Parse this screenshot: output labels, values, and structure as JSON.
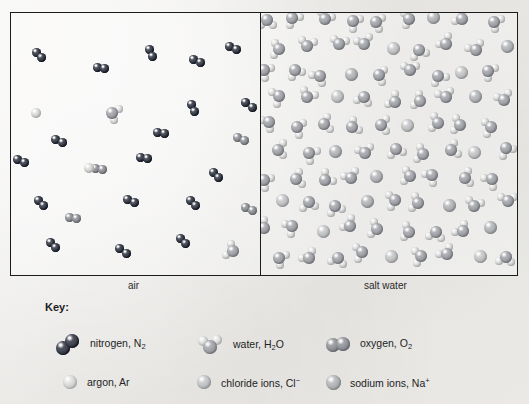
{
  "figure": {
    "panels": [
      {
        "id": "air",
        "caption": "air"
      },
      {
        "id": "salt-water",
        "caption": "salt water"
      }
    ]
  },
  "key": {
    "title": "Key:",
    "entries": [
      {
        "id": "nitrogen",
        "icon": "nitrogen-molecule-icon",
        "label_html": "nitrogen, N<sub>2</sub>",
        "label_text": "nitrogen, N2"
      },
      {
        "id": "water",
        "icon": "water-molecule-icon",
        "label_html": "water, H<sub>2</sub>O",
        "label_text": "water, H2O"
      },
      {
        "id": "oxygen",
        "icon": "oxygen-molecule-icon",
        "label_html": "oxygen, O<sub>2</sub>",
        "label_text": "oxygen, O2"
      },
      {
        "id": "argon",
        "icon": "argon-atom-icon",
        "label_html": "argon, Ar",
        "label_text": "argon, Ar"
      },
      {
        "id": "chloride-ion",
        "icon": "chloride-ion-icon",
        "label_html": "chloride ions, Cl<sup>&#8722;</sup>",
        "label_text": "chloride ions, Cl-"
      },
      {
        "id": "sodium-ion",
        "icon": "sodium-ion-icon",
        "label_html": "sodium ions, Na<sup>+</sup>",
        "label_text": "sodium ions, Na+"
      }
    ]
  },
  "colors": {
    "nitrogen": "#3b3f४a",
    "nitrogen_hex": "#3a3e49",
    "oxygen": "#8b8d92",
    "water_oxygen": "#9a9ca1",
    "hydrogen": "#d2d3d2",
    "argon": "#cfd0ce",
    "chloride": "#b9babb",
    "sodium": "#a9abae",
    "frame": "#1c1c1c",
    "paper": "#efeeec",
    "text": "#232323"
  },
  "chart_data": {
    "type": "diagram",
    "particle_sizes": {
      "nitrogen_atom": 9,
      "oxygen_atom": 9,
      "water_oxygen": 12,
      "water_hydrogen": 8,
      "argon_atom": 10,
      "chloride_ion": 13,
      "sodium_ion": 13
    },
    "panels": [
      {
        "id": "air",
        "caption": "air",
        "description": "Sparse, widely separated particles representing a gas",
        "composition": [
          {
            "species": "nitrogen, N2",
            "count": 18
          },
          {
            "species": "oxygen, O2",
            "count": 5
          },
          {
            "species": "argon, Ar",
            "count": 2
          },
          {
            "species": "water, H2O",
            "count": 2
          }
        ],
        "molecules": [
          {
            "type": "nitrogen",
            "x": 28,
            "y": 42,
            "rot": 38
          },
          {
            "type": "nitrogen",
            "x": 90,
            "y": 55,
            "rot": 8
          },
          {
            "type": "nitrogen",
            "x": 140,
            "y": 40,
            "rot": 62
          },
          {
            "type": "nitrogen",
            "x": 186,
            "y": 48,
            "rot": 25
          },
          {
            "type": "nitrogen",
            "x": 222,
            "y": 35,
            "rot": 18
          },
          {
            "type": "argon",
            "x": 25,
            "y": 100,
            "rot": 0
          },
          {
            "type": "water",
            "x": 101,
            "y": 100,
            "rot": 20
          },
          {
            "type": "nitrogen",
            "x": 182,
            "y": 95,
            "rot": 72
          },
          {
            "type": "nitrogen",
            "x": 238,
            "y": 92,
            "rot": 35
          },
          {
            "type": "nitrogen",
            "x": 48,
            "y": 128,
            "rot": 28
          },
          {
            "type": "nitrogen",
            "x": 150,
            "y": 120,
            "rot": 12
          },
          {
            "type": "oxygen",
            "x": 230,
            "y": 126,
            "rot": 22
          },
          {
            "type": "nitrogen",
            "x": 10,
            "y": 148,
            "rot": 30
          },
          {
            "type": "oxygen",
            "x": 88,
            "y": 156,
            "rot": 10
          },
          {
            "type": "nitrogen",
            "x": 133,
            "y": 145,
            "rot": 15
          },
          {
            "type": "nitrogen",
            "x": 205,
            "y": 162,
            "rot": 52
          },
          {
            "type": "argon",
            "x": 78,
            "y": 155,
            "rot": 0
          },
          {
            "type": "nitrogen",
            "x": 30,
            "y": 190,
            "rot": 42
          },
          {
            "type": "nitrogen",
            "x": 120,
            "y": 188,
            "rot": 20
          },
          {
            "type": "nitrogen",
            "x": 182,
            "y": 190,
            "rot": 44
          },
          {
            "type": "oxygen",
            "x": 238,
            "y": 196,
            "rot": 30
          },
          {
            "type": "nitrogen",
            "x": 42,
            "y": 232,
            "rot": 50
          },
          {
            "type": "nitrogen",
            "x": 112,
            "y": 238,
            "rot": 34
          },
          {
            "type": "nitrogen",
            "x": 172,
            "y": 228,
            "rot": 48
          },
          {
            "type": "water",
            "x": 222,
            "y": 238,
            "rot": 200
          },
          {
            "type": "oxygen",
            "x": 62,
            "y": 205,
            "rot": 15
          }
        ]
      },
      {
        "id": "salt-water",
        "caption": "salt water",
        "description": "Densely packed water molecules with dissolved sodium and chloride ions",
        "composition": [
          {
            "species": "water, H2O",
            "count": 88
          },
          {
            "species": "sodium ions, Na+",
            "count": 9
          },
          {
            "species": "chloride ions, Cl-",
            "count": 9
          }
        ],
        "grid": {
          "cols": 9,
          "rows": 10,
          "cell_w": 28,
          "cell_h": 26,
          "jitter": 7
        },
        "ion_cells": [
          {
            "index": 6,
            "type": "sodium"
          },
          {
            "index": 13,
            "type": "chloride"
          },
          {
            "index": 21,
            "type": "sodium"
          },
          {
            "index": 29,
            "type": "chloride"
          },
          {
            "index": 34,
            "type": "sodium"
          },
          {
            "index": 41,
            "type": "chloride"
          },
          {
            "index": 47,
            "type": "sodium"
          },
          {
            "index": 52,
            "type": "chloride"
          },
          {
            "index": 58,
            "type": "sodium"
          },
          {
            "index": 63,
            "type": "chloride"
          },
          {
            "index": 69,
            "type": "sodium"
          },
          {
            "index": 74,
            "type": "chloride"
          },
          {
            "index": 80,
            "type": "sodium"
          },
          {
            "index": 85,
            "type": "chloride"
          },
          {
            "index": 17,
            "type": "sodium"
          },
          {
            "index": 25,
            "type": "chloride"
          },
          {
            "index": 66,
            "type": "sodium"
          },
          {
            "index": 88,
            "type": "chloride"
          }
        ]
      }
    ]
  }
}
